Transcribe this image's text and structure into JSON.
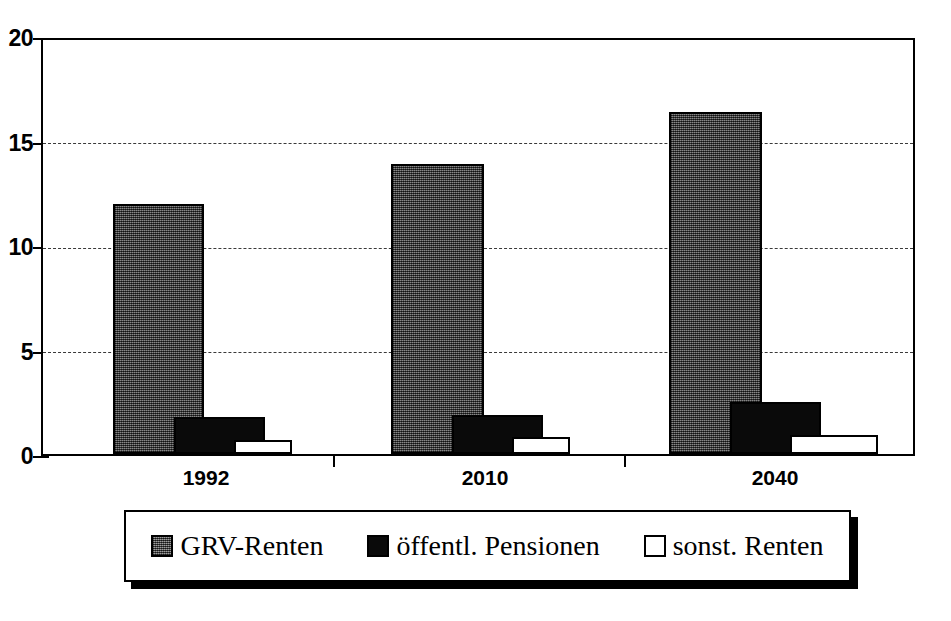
{
  "chart_data": {
    "type": "bar",
    "title": "",
    "subtitle": "",
    "xlabel": "",
    "ylabel": "",
    "categories": [
      "1992",
      "2010",
      "2040"
    ],
    "series": [
      {
        "name": "GRV-Renten",
        "values": [
          12.1,
          14.0,
          16.5
        ],
        "color": "#4a4a4a",
        "fill": "gray-halftone"
      },
      {
        "name": "öffentl. Pensionen",
        "values": [
          1.8,
          1.9,
          2.5
        ],
        "color": "#0a0a0a",
        "fill": "solid-black"
      },
      {
        "name": "sonst. Renten",
        "values": [
          0.7,
          0.8,
          0.9
        ],
        "color": "#ffffff",
        "fill": "white-outline"
      }
    ],
    "ylim": [
      0,
      20
    ],
    "yticks": [
      0,
      5,
      10,
      15,
      20
    ],
    "ytick_labels": [
      "0",
      "5",
      "10",
      "15",
      "20"
    ],
    "grid": true,
    "grid_style": "dashed-horizontal",
    "legend_position": "bottom",
    "legend_entries": [
      "GRV-Renten",
      "öffentl. Pensionen",
      "sonst. Renten"
    ]
  },
  "axis": {
    "y_labels": [
      "20",
      "15",
      "10",
      "5",
      "0"
    ],
    "x_labels": [
      "1992",
      "2010",
      "2040"
    ]
  },
  "legend": {
    "items": [
      {
        "label": "GRV-Renten"
      },
      {
        "label": "öffentl. Pensionen"
      },
      {
        "label": "sonst. Renten"
      }
    ]
  }
}
